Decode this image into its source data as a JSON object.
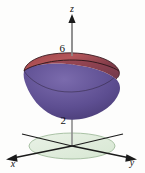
{
  "figure": {
    "title": "",
    "type": "3d-surface-plot",
    "background_color": "#fdfdfc"
  },
  "axes": {
    "z": {
      "label": "z",
      "arrow": "up",
      "color": "#6b6b6b"
    },
    "x": {
      "label": "x",
      "arrow": "down-left",
      "color": "#1a1a1a"
    },
    "y": {
      "label": "y",
      "arrow": "down-right",
      "color": "#1a1a1a"
    }
  },
  "ticks": {
    "z": [
      {
        "value": "6",
        "label": "6"
      },
      {
        "value": "2",
        "label": "2"
      }
    ]
  },
  "surfaces": {
    "cap": {
      "name": "top-plane-cap",
      "color_light": "#b4565a",
      "color_dark": "#8e3a42",
      "edge_color": "#2a1418"
    },
    "bowl": {
      "name": "paraboloid-bowl",
      "color_light": "#7c6aa8",
      "color_dark": "#4e3f7d",
      "edge_color": "#241a33"
    },
    "plane_region": {
      "name": "xy-plane-ellipse",
      "fill": "#e4efe1",
      "stroke": "#8fae8b"
    }
  },
  "icons": {
    "z_axis_arrow": "arrow-up-icon",
    "x_axis_arrow": "arrow-left-icon",
    "y_axis_arrow": "arrow-right-icon"
  }
}
